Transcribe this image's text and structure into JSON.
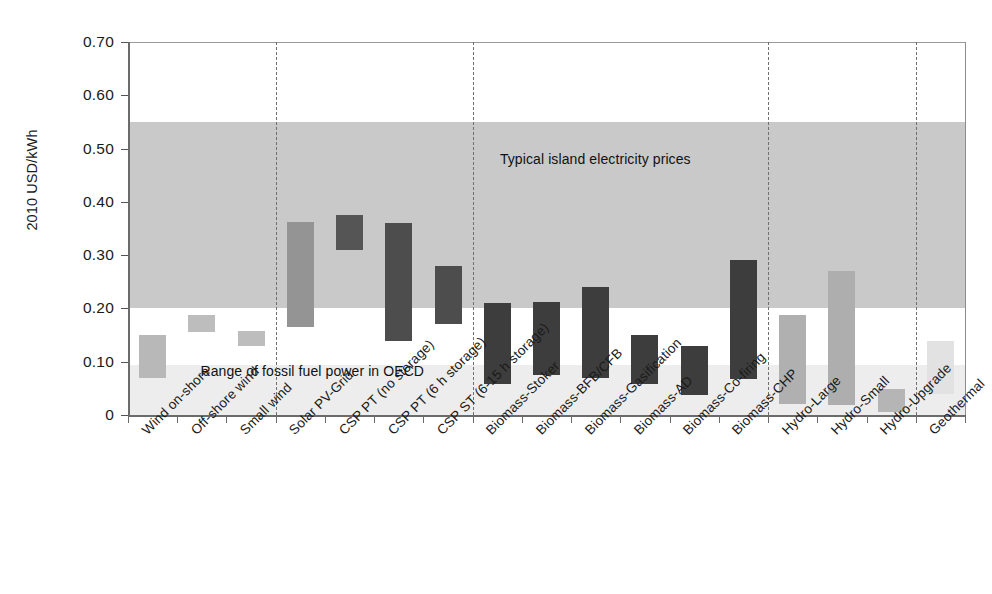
{
  "chart_data": {
    "type": "bar",
    "title": "",
    "xlabel": "",
    "ylabel": "2010 USD/kWh",
    "ylim": [
      0,
      0.7
    ],
    "ytick_labels": [
      "0.70",
      "0.60",
      "0.50",
      "0.40",
      "0.30",
      "0.20",
      "0.10",
      "0"
    ],
    "ytick_values": [
      0.7,
      0.6,
      0.5,
      0.4,
      0.3,
      0.2,
      0.1,
      0
    ],
    "grid": false,
    "legend_position": "none",
    "note": "Floating range bars: each category shows a low-to-high cost range.",
    "categories": [
      "Wind on-shore",
      "Off-shore wind",
      "Small wind",
      "Solar PV-Grid",
      "CSP PT (no storage)",
      "CSP PT (6 h storage)",
      "CSP ST (6-15 h storage)",
      "Biomass-Stoker",
      "Biomass-BFB/CFB",
      "Biomass-Gasification",
      "Biomass-AD",
      "Biomass-Co-firing",
      "Biomass-CHP",
      "Hydro-Large",
      "Hydro-Small",
      "Hydro-Upgrade",
      "Geothermal"
    ],
    "ranges": [
      {
        "category": "Wind on-shore",
        "low": 0.07,
        "high": 0.15,
        "color": "#b8b8b8"
      },
      {
        "category": "Off-shore wind",
        "low": 0.155,
        "high": 0.187,
        "color": "#bdbdbd"
      },
      {
        "category": "Small wind",
        "low": 0.13,
        "high": 0.157,
        "color": "#bdbdbd"
      },
      {
        "category": "Solar PV-Grid",
        "low": 0.165,
        "high": 0.362,
        "color": "#949494"
      },
      {
        "category": "CSP PT (no storage)",
        "low": 0.31,
        "high": 0.375,
        "color": "#555555"
      },
      {
        "category": "CSP PT (6 h storage)",
        "low": 0.138,
        "high": 0.36,
        "color": "#4d4d4d"
      },
      {
        "category": "CSP ST (6-15 h storage)",
        "low": 0.17,
        "high": 0.28,
        "color": "#4d4d4d"
      },
      {
        "category": "Biomass-Stoker",
        "low": 0.058,
        "high": 0.21,
        "color": "#3d3d3d"
      },
      {
        "category": "Biomass-BFB/CFB",
        "low": 0.075,
        "high": 0.212,
        "color": "#3d3d3d"
      },
      {
        "category": "Biomass-Gasification",
        "low": 0.07,
        "high": 0.24,
        "color": "#3d3d3d"
      },
      {
        "category": "Biomass-AD",
        "low": 0.058,
        "high": 0.15,
        "color": "#3d3d3d"
      },
      {
        "category": "Biomass-Co-firing",
        "low": 0.038,
        "high": 0.13,
        "color": "#3d3d3d"
      },
      {
        "category": "Biomass-CHP",
        "low": 0.068,
        "high": 0.29,
        "color": "#3d3d3d"
      },
      {
        "category": "Hydro-Large",
        "low": 0.02,
        "high": 0.188,
        "color": "#b0b0b0"
      },
      {
        "category": "Hydro-Small",
        "low": 0.018,
        "high": 0.27,
        "color": "#aeaeae"
      },
      {
        "category": "Hydro-Upgrade",
        "low": 0.005,
        "high": 0.048,
        "color": "#b5b5b5"
      },
      {
        "category": "Geothermal",
        "low": 0.04,
        "high": 0.138,
        "color": "#e2e2e2"
      }
    ],
    "bands": [
      {
        "name": "Typical island electricity prices",
        "low": 0.2,
        "high": 0.55,
        "color": "#c9c9c9"
      },
      {
        "name": "Range of fossil fuel power in OECD",
        "low": 0.0,
        "high": 0.093,
        "color": "#ededed"
      }
    ],
    "annotations": [
      {
        "text": "Typical island electricity prices",
        "x_category_index": 8,
        "y": 0.48
      },
      {
        "text": "Range of fossil fuel power in OECD",
        "x_category_index": 2,
        "y": 0.082
      }
    ],
    "group_separators_after": [
      "Small wind",
      "CSP ST (6-15 h storage)",
      "Biomass-CHP",
      "Hydro-Upgrade"
    ],
    "colors": {
      "island_band": "#c9c9c9",
      "fossil_band": "#ededed",
      "axis": "#6b6b6b",
      "separator": "#6f6f6f",
      "bar_dark": "#3d3d3d",
      "bar_mid": "#949494",
      "bar_light": "#b8b8b8"
    }
  }
}
